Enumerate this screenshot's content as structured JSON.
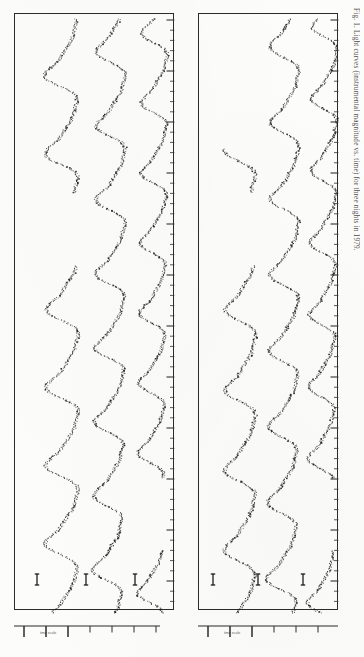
{
  "figure": {
    "kind": "scanned-journal-figure",
    "orientation": "landscape-rotated-90",
    "caption": "Fig. 1. Light curves (instrumental magnitude vs. time) for three nights in 1979.",
    "panel_count": 2,
    "curves_per_panel": 3,
    "ink_color": "#1d1d1d",
    "paper_color": "#fcfcfb",
    "frame_color": "#2b2b2b"
  },
  "panels": [
    {
      "id": "panel-left",
      "name": "left-panel",
      "x": 14,
      "y": 13,
      "width": 160,
      "height": 597,
      "error_markers": [
        {
          "x": 22,
          "y": 573,
          "height": 11
        },
        {
          "x": 71,
          "y": 573,
          "height": 11
        },
        {
          "x": 120,
          "y": 573,
          "height": 11
        }
      ],
      "axis": {
        "x": 14,
        "y": 620,
        "width": 146,
        "major_ticks": [
          10,
          32,
          54
        ],
        "minor_ticks": [
          76,
          98,
          120,
          142
        ],
        "scale_label": "time scale",
        "scale_label_x": 26,
        "scale_label_y": 631
      }
    },
    {
      "id": "panel-right",
      "name": "right-panel",
      "x": 198,
      "y": 13,
      "width": 140,
      "height": 597,
      "error_markers": [
        {
          "x": 14,
          "y": 573,
          "height": 11
        },
        {
          "x": 59,
          "y": 573,
          "height": 11
        },
        {
          "x": 104,
          "y": 573,
          "height": 11
        }
      ],
      "axis": {
        "x": 198,
        "y": 620,
        "width": 140,
        "major_ticks": [
          10,
          32,
          54
        ],
        "minor_ticks": [
          76,
          98,
          120
        ],
        "scale_label": "time scale",
        "scale_label_x": 26,
        "scale_label_y": 631
      }
    }
  ],
  "chart_data": {
    "type": "line",
    "xlabel": "time",
    "ylabel": "instrumental magnitude",
    "orientation": "traces run vertically (time axis vertical, magnitude horizontal)",
    "grid": false,
    "legend": "none",
    "xlim": [
      0,
      1
    ],
    "ylim": [
      0,
      1
    ],
    "panels": [
      {
        "name": "left-panel",
        "series": [
          {
            "name": "star-A-left",
            "baseline_x": 48,
            "amplitude": 19,
            "period": 78,
            "phase": 0.15,
            "noise": 1.8,
            "y_start": 18,
            "y_end": 612
          },
          {
            "name": "star-B-left",
            "baseline_x": 96,
            "amplitude": 17,
            "period": 74,
            "phase": 1.9,
            "noise": 1.7,
            "y_start": 18,
            "y_end": 612
          },
          {
            "name": "star-C-left",
            "baseline_x": 140,
            "amplitude": 15,
            "period": 70,
            "phase": 3.4,
            "noise": 1.6,
            "y_start": 18,
            "y_end": 612
          }
        ]
      },
      {
        "name": "right-panel",
        "series": [
          {
            "name": "star-A-right",
            "baseline_x": 42,
            "amplitude": 18,
            "period": 80,
            "phase": 0.7,
            "noise": 1.8,
            "y_start": 148,
            "y_end": 612
          },
          {
            "name": "star-B-right",
            "baseline_x": 86,
            "amplitude": 17,
            "period": 76,
            "phase": 2.4,
            "noise": 1.7,
            "y_start": 18,
            "y_end": 612
          },
          {
            "name": "star-C-right",
            "baseline_x": 126,
            "amplitude": 15,
            "period": 72,
            "phase": 4.0,
            "noise": 1.6,
            "y_start": 18,
            "y_end": 612
          }
        ]
      }
    ]
  }
}
